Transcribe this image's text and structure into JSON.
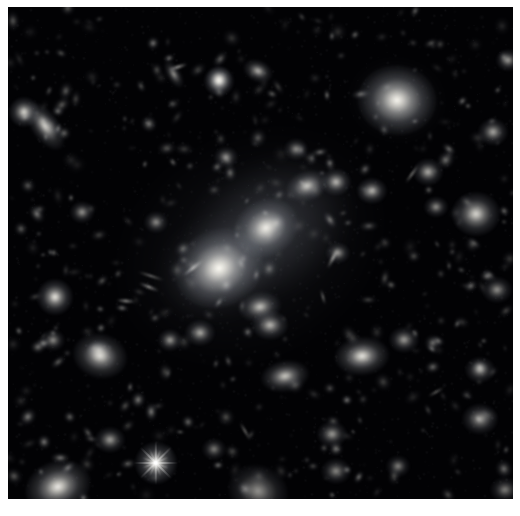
{
  "image": {
    "kind": "astronomy-deep-field",
    "subject": "galaxy cluster core",
    "alt_text": "Deep field astronomical image of a rich galaxy cluster with two dominant giant elliptical galaxies near the center, surrounded by hundreds of smaller elliptical and spiral galaxies and a few foreground stars with diffraction spikes, on a black sky background.",
    "border_color": "#ffffff",
    "sky_color": "#020204",
    "object_color": "#fdfbf4",
    "halo_color": "#b9bcc4",
    "width": 520,
    "height": 516,
    "plate": {
      "x": 8,
      "y": 7,
      "w": 505,
      "h": 492
    }
  },
  "diffuse_halos": [
    {
      "name": "cd-galaxy-envelope-main",
      "x": 268,
      "y": 229,
      "rx": 92,
      "ry": 66,
      "rot": -32,
      "opacity": 0.3,
      "color": "#9aa0ab"
    },
    {
      "name": "cd-galaxy-envelope-west",
      "x": 219,
      "y": 268,
      "rx": 62,
      "ry": 48,
      "rot": -24,
      "opacity": 0.3,
      "color": "#9aa0ab"
    },
    {
      "name": "intracluster-light",
      "x": 250,
      "y": 246,
      "rx": 150,
      "ry": 118,
      "rot": -30,
      "opacity": 0.13,
      "color": "#7e838e"
    },
    {
      "name": "ngc-halo-upper-right",
      "x": 397,
      "y": 100,
      "rx": 42,
      "ry": 34,
      "rot": 10,
      "opacity": 0.26,
      "color": "#9aa0ab"
    }
  ],
  "bright_objects": [
    {
      "name": "giant-elliptical-west",
      "x": 219,
      "y": 268,
      "r": 15,
      "rot": -25,
      "e": 0.85,
      "b": 1.0
    },
    {
      "name": "giant-elliptical-center",
      "x": 266,
      "y": 228,
      "r": 11,
      "rot": -30,
      "e": 0.85,
      "b": 0.95
    },
    {
      "name": "elliptical-upper-right",
      "x": 397,
      "y": 100,
      "r": 13,
      "rot": 5,
      "e": 0.88,
      "b": 0.98
    },
    {
      "name": "foreground-star-spiked",
      "x": 156,
      "y": 463,
      "r": 7,
      "rot": 0,
      "e": 1.0,
      "b": 1.0,
      "spikes": 8,
      "spike_len": 44
    },
    {
      "name": "star-lower-left",
      "x": 55,
      "y": 297,
      "r": 6,
      "rot": 0,
      "e": 1.0,
      "b": 0.92
    },
    {
      "name": "elliptical-lower-left-edge",
      "x": 58,
      "y": 487,
      "r": 11,
      "rot": -20,
      "e": 0.78,
      "b": 0.94
    },
    {
      "name": "elliptical-mid-left",
      "x": 100,
      "y": 356,
      "r": 9,
      "rot": 15,
      "e": 0.82,
      "b": 0.88
    },
    {
      "name": "elliptical-lower-center",
      "x": 362,
      "y": 356,
      "r": 9,
      "rot": -5,
      "e": 0.7,
      "b": 0.92
    },
    {
      "name": "elliptical-right-mid",
      "x": 476,
      "y": 214,
      "r": 8,
      "rot": 0,
      "e": 0.92,
      "b": 0.86
    },
    {
      "name": "spiral-lower-center",
      "x": 258,
      "y": 491,
      "r": 10,
      "rot": 20,
      "e": 0.85,
      "b": 0.58
    },
    {
      "name": "galaxy-left-elongated",
      "x": 45,
      "y": 126,
      "r": 9,
      "rot": 55,
      "e": 0.5,
      "b": 0.84
    },
    {
      "name": "star-left-of-galaxy",
      "x": 24,
      "y": 112,
      "r": 5,
      "rot": 0,
      "e": 1.0,
      "b": 0.86
    },
    {
      "name": "star-top-center",
      "x": 219,
      "y": 81,
      "r": 5,
      "rot": 0,
      "e": 1.0,
      "b": 0.94
    },
    {
      "name": "star-top-right",
      "x": 219,
      "y": 79,
      "r": 4,
      "rot": 0,
      "e": 1.0,
      "b": 0.7
    },
    {
      "name": "elliptical-top-mid",
      "x": 258,
      "y": 71,
      "r": 5,
      "rot": 25,
      "e": 0.7,
      "b": 0.72
    }
  ],
  "medium_objects": [
    {
      "x": 307,
      "y": 186,
      "r": 7,
      "rot": -20,
      "e": 0.72,
      "b": 0.8
    },
    {
      "x": 336,
      "y": 182,
      "r": 5,
      "rot": 0,
      "e": 0.9,
      "b": 0.74
    },
    {
      "x": 372,
      "y": 191,
      "r": 5,
      "rot": 0,
      "e": 0.88,
      "b": 0.72
    },
    {
      "x": 428,
      "y": 172,
      "r": 5,
      "rot": 0,
      "e": 0.9,
      "b": 0.7
    },
    {
      "x": 493,
      "y": 132,
      "r": 5,
      "rot": 0,
      "e": 0.9,
      "b": 0.68
    },
    {
      "x": 260,
      "y": 307,
      "r": 7,
      "rot": -10,
      "e": 0.72,
      "b": 0.78
    },
    {
      "x": 270,
      "y": 325,
      "r": 6,
      "rot": 0,
      "e": 0.8,
      "b": 0.74
    },
    {
      "x": 285,
      "y": 376,
      "r": 8,
      "rot": -10,
      "e": 0.64,
      "b": 0.8
    },
    {
      "x": 200,
      "y": 333,
      "r": 5,
      "rot": 0,
      "e": 0.88,
      "b": 0.68
    },
    {
      "x": 170,
      "y": 340,
      "r": 4,
      "rot": 0,
      "e": 0.9,
      "b": 0.62
    },
    {
      "x": 110,
      "y": 440,
      "r": 5,
      "rot": 0,
      "e": 0.88,
      "b": 0.64
    },
    {
      "x": 332,
      "y": 434,
      "r": 5,
      "rot": 0,
      "e": 0.86,
      "b": 0.62
    },
    {
      "x": 338,
      "y": 253,
      "r": 4,
      "rot": 0,
      "e": 0.88,
      "b": 0.6
    },
    {
      "x": 404,
      "y": 340,
      "r": 5,
      "rot": 0,
      "e": 0.88,
      "b": 0.62
    },
    {
      "x": 480,
      "y": 370,
      "r": 5,
      "rot": 0,
      "e": 0.88,
      "b": 0.62
    },
    {
      "x": 480,
      "y": 419,
      "r": 6,
      "rot": 0,
      "e": 0.86,
      "b": 0.66
    },
    {
      "x": 436,
      "y": 207,
      "r": 4,
      "rot": 0,
      "e": 0.88,
      "b": 0.58
    },
    {
      "x": 82,
      "y": 212,
      "r": 4,
      "rot": 0,
      "e": 0.9,
      "b": 0.6
    },
    {
      "x": 99,
      "y": 350,
      "r": 4,
      "rot": 0,
      "e": 0.9,
      "b": 0.56
    },
    {
      "x": 53,
      "y": 340,
      "r": 4,
      "rot": 0,
      "e": 0.9,
      "b": 0.56
    },
    {
      "x": 156,
      "y": 222,
      "r": 4,
      "rot": 0,
      "e": 0.9,
      "b": 0.56
    },
    {
      "x": 226,
      "y": 157,
      "r": 4,
      "rot": 0,
      "e": 0.9,
      "b": 0.56
    },
    {
      "x": 296,
      "y": 149,
      "r": 4,
      "rot": 0,
      "e": 0.9,
      "b": 0.56
    },
    {
      "x": 398,
      "y": 466,
      "r": 4,
      "rot": 0,
      "e": 0.9,
      "b": 0.52
    },
    {
      "x": 214,
      "y": 449,
      "r": 4,
      "rot": 0,
      "e": 0.9,
      "b": 0.5
    },
    {
      "x": 336,
      "y": 471,
      "r": 5,
      "rot": 0,
      "e": 0.86,
      "b": 0.54
    },
    {
      "x": 174,
      "y": 74,
      "r": 5,
      "rot": 60,
      "e": 0.45,
      "b": 0.6
    },
    {
      "x": 508,
      "y": 60,
      "r": 4,
      "rot": 0,
      "e": 0.9,
      "b": 0.62
    },
    {
      "x": 497,
      "y": 290,
      "r": 5,
      "rot": 0,
      "e": 0.88,
      "b": 0.58
    },
    {
      "x": 505,
      "y": 490,
      "r": 5,
      "rot": 0,
      "e": 0.88,
      "b": 0.5
    }
  ],
  "edge_on_streaks": [
    {
      "name": "edge-on-spiral-1",
      "x": 193,
      "y": 268,
      "len": 26,
      "w": 3,
      "rot": -38,
      "b": 0.62
    },
    {
      "name": "edge-on-spiral-2",
      "x": 149,
      "y": 287,
      "len": 22,
      "w": 3,
      "rot": 22,
      "b": 0.5
    },
    {
      "name": "edge-on-spiral-3",
      "x": 412,
      "y": 174,
      "len": 22,
      "w": 2,
      "rot": -55,
      "b": 0.52
    },
    {
      "name": "edge-on-spiral-4",
      "x": 333,
      "y": 258,
      "len": 24,
      "w": 3,
      "rot": -62,
      "b": 0.55
    },
    {
      "name": "edge-on-spiral-5",
      "x": 126,
      "y": 301,
      "len": 20,
      "w": 3,
      "rot": 5,
      "b": 0.5
    },
    {
      "name": "edge-on-spiral-6",
      "x": 245,
      "y": 431,
      "len": 20,
      "w": 2,
      "rot": 60,
      "b": 0.45
    },
    {
      "name": "edge-on-spiral-7",
      "x": 151,
      "y": 276,
      "len": 28,
      "w": 2,
      "rot": 18,
      "b": 0.44
    },
    {
      "name": "edge-on-spiral-8",
      "x": 436,
      "y": 392,
      "len": 18,
      "w": 2,
      "rot": -30,
      "b": 0.42
    },
    {
      "name": "edge-on-spiral-9",
      "x": 178,
      "y": 67,
      "len": 20,
      "w": 3,
      "rot": -18,
      "b": 0.55
    },
    {
      "name": "edge-on-spiral-10",
      "x": 323,
      "y": 297,
      "len": 16,
      "w": 2,
      "rot": 75,
      "b": 0.44
    }
  ],
  "faint_field": {
    "count": 420,
    "seed": 20240517,
    "min_r": 0.9,
    "max_r": 3.2,
    "min_b": 0.1,
    "max_b": 0.55
  }
}
